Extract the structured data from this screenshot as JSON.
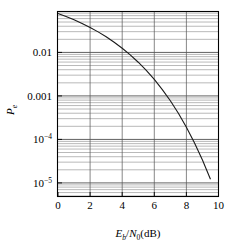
{
  "figure": {
    "background_color": "#ffffff",
    "frame_color": "#000000",
    "grid_color": "#7a7a7a",
    "curve_color": "#1a1a1a"
  },
  "axes": {
    "x": {
      "title_parts": {
        "e": "E",
        "b": "b",
        "slash": "/",
        "n": "N",
        "zero": "0",
        "unit": "(dB)"
      },
      "title_full": "Eb/N0(dB)",
      "ticks": [
        0,
        2,
        4,
        6,
        8,
        10
      ],
      "tick_labels": [
        "0",
        "2",
        "4",
        "6",
        "8",
        "10"
      ],
      "min": 0,
      "max": 10
    },
    "y": {
      "title_parts": {
        "p": "P",
        "e": "e"
      },
      "title_full": "Pe",
      "scale": "log",
      "ticks": [
        0.01,
        0.001,
        0.0001,
        1e-05
      ],
      "tick_labels": [
        "0.01",
        "0.001",
        "10-4",
        "10-5"
      ],
      "tick_labels_display": [
        {
          "text": "0.01",
          "sup": ""
        },
        {
          "text": "0.001",
          "sup": ""
        },
        {
          "text": "10",
          "sup": "−4"
        },
        {
          "text": "10",
          "sup": "−5"
        }
      ],
      "min": 5e-06,
      "max": 0.085
    }
  },
  "chart_data": {
    "type": "line",
    "title": "",
    "xlabel": "Eb/N0(dB)",
    "ylabel": "Pe",
    "xlim": [
      0,
      10
    ],
    "ylim": [
      5e-06,
      0.085
    ],
    "yscale": "log",
    "grid": true,
    "grid_style": "log-minor-horizontal-and-major-vertical",
    "legend": null,
    "series": [
      {
        "name": "BPSK bit error probability",
        "x": [
          0,
          0.5,
          1,
          1.5,
          2,
          2.5,
          3,
          3.5,
          4,
          4.5,
          5,
          5.5,
          6,
          6.5,
          7,
          7.5,
          8,
          8.5,
          9,
          9.5,
          10
        ],
        "y": [
          0.0786,
          0.0671,
          0.0563,
          0.0464,
          0.0375,
          0.0297,
          0.0229,
          0.0171,
          0.0125,
          0.00879,
          0.00595,
          0.00386,
          0.00239,
          0.0014,
          0.000773,
          0.000398,
          0.000191,
          8.4e-05,
          3.36e-05,
          1.21e-05,
          3.87e-06
        ]
      }
    ]
  },
  "caption": ""
}
